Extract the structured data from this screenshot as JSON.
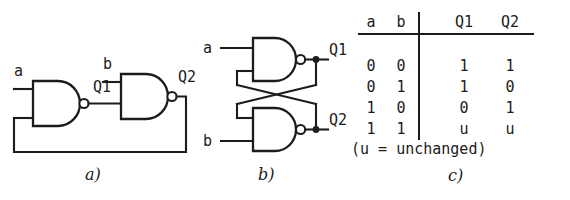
{
  "figure": {
    "background_color": "#ffffff",
    "ink_color": "#1c1c1c"
  },
  "panel_a": {
    "caption": "a)",
    "description": "two cascaded NAND gates with feedback from Q2 to first gate input",
    "labels": {
      "input_a": "a",
      "node_q1": "Q1",
      "input_b": "b",
      "output_q2": "Q2"
    },
    "gates": [
      {
        "name": "nand-gate-1",
        "type": "NAND",
        "inputs": [
          "a",
          "Q2-feedback"
        ],
        "output": "Q1"
      },
      {
        "name": "nand-gate-2",
        "type": "NAND",
        "inputs": [
          "b",
          "Q1"
        ],
        "output": "Q2"
      }
    ]
  },
  "panel_b": {
    "caption": "b)",
    "description": "cross-coupled NAND latch",
    "labels": {
      "input_a": "a",
      "input_b": "b",
      "output_q1": "Q1",
      "output_q2": "Q2"
    },
    "gates": [
      {
        "name": "nand-gate-top",
        "type": "NAND",
        "inputs": [
          "a",
          "Q2"
        ],
        "output": "Q1"
      },
      {
        "name": "nand-gate-bottom",
        "type": "NAND",
        "inputs": [
          "b",
          "Q1"
        ],
        "output": "Q2"
      }
    ]
  },
  "panel_c": {
    "caption": "c)",
    "note": "(u = unchanged)",
    "table": {
      "headers": [
        "a",
        "b",
        "Q1",
        "Q2"
      ],
      "rows": [
        [
          "0",
          "0",
          "1",
          "1"
        ],
        [
          "0",
          "1",
          "1",
          "0"
        ],
        [
          "1",
          "0",
          "0",
          "1"
        ],
        [
          "1",
          "1",
          "u",
          "u"
        ]
      ]
    }
  }
}
